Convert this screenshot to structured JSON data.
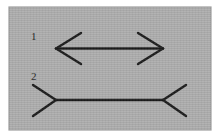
{
  "canvas": {
    "width": 220,
    "height": 137,
    "page_background": "#ffffff"
  },
  "plate": {
    "name": "illusion-plate",
    "x": 9,
    "y": 7,
    "width": 202,
    "height": 123,
    "fill": "#adadad",
    "edge_shadow": "#9a9a9a"
  },
  "style": {
    "stroke_color": "#1a1a1a",
    "stroke_width": 2.4,
    "label_color": "#1f1f1f",
    "label_font_size": 11
  },
  "figures": [
    {
      "id": "figure-1",
      "label": "1",
      "label_x": 31,
      "label_y": 40,
      "type": "arrowheads-outward",
      "description": "Line with outward-pointing arrowheads at both ends (appears shorter)",
      "shaft": {
        "x1": 56,
        "y1": 48.5,
        "x2": 163,
        "y2": 48.5
      },
      "fins": [
        {
          "name": "left-upper-fin",
          "x1": 56,
          "y1": 48.5,
          "x2": 81,
          "y2": 33
        },
        {
          "name": "left-lower-fin",
          "x1": 56,
          "y1": 48.5,
          "x2": 81,
          "y2": 64
        },
        {
          "name": "right-upper-fin",
          "x1": 163,
          "y1": 48.5,
          "x2": 138,
          "y2": 33
        },
        {
          "name": "right-lower-fin",
          "x1": 163,
          "y1": 48.5,
          "x2": 138,
          "y2": 64
        }
      ]
    },
    {
      "id": "figure-2",
      "label": "2",
      "label_x": 31,
      "label_y": 80,
      "type": "arrowheads-inward",
      "description": "Line with inward-pointing (reversed) arrow tails at both ends (appears longer)",
      "shaft": {
        "x1": 56,
        "y1": 100,
        "x2": 163,
        "y2": 100
      },
      "fins": [
        {
          "name": "left-upper-fin",
          "x1": 56,
          "y1": 100,
          "x2": 33,
          "y2": 85
        },
        {
          "name": "left-lower-fin",
          "x1": 56,
          "y1": 100,
          "x2": 33,
          "y2": 116
        },
        {
          "name": "right-upper-fin",
          "x1": 163,
          "y1": 100,
          "x2": 186,
          "y2": 85
        },
        {
          "name": "right-lower-fin",
          "x1": 163,
          "y1": 100,
          "x2": 186,
          "y2": 116
        }
      ]
    }
  ]
}
